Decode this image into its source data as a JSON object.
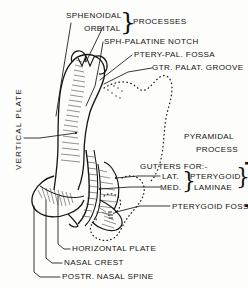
{
  "figure": {
    "background_color": "#fdfdfb",
    "ink_color": "#141414"
  },
  "labels": {
    "vertical_plate": "VERTICAL PLATE",
    "sphenoidal": "SPHENOIDAL",
    "orbital": "ORBITAL",
    "processes": "PROCESSES",
    "sph_palatine_notch": "SPH-PALATINE NOTCH",
    "ptery_pal_fossa": "PTERY-PAL. FOSSA",
    "gtr_palat_groove": "GTR. PALAT. GROOVE",
    "pyramidal": "PYRAMIDAL",
    "process": "PROCESS",
    "gutters_for": "GUTTERS FOR:-",
    "lat": "LAT.",
    "med": "MED.",
    "pterygoid": "PTERYGOID",
    "laminae": "LAMINAE",
    "pterygoid_fossa": "PTERYGOID FOSSA",
    "horizontal_plate": "HORIZONTAL PLATE",
    "nasal_crest": "NASAL CREST",
    "postr_nasal_spine": "POSTR. NASAL SPINE"
  },
  "braces": {
    "processes_brace": "}",
    "laminae_brace": "}",
    "group_brace": "}"
  }
}
